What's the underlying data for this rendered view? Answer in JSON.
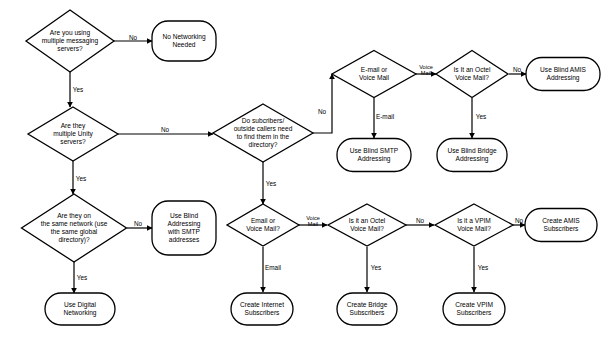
{
  "diagram": {
    "type": "flowchart",
    "background_color": "#ffffff",
    "stroke_color": "#000000",
    "text_color": "#000000",
    "nodes": [
      {
        "id": "q_multi_messaging",
        "shape": "diamond",
        "cx": 70,
        "cy": 41,
        "w": 88,
        "h": 62,
        "lines": [
          "Are you using",
          "multiple messaging",
          "servers?"
        ]
      },
      {
        "id": "t_no_networking",
        "shape": "rounded",
        "cx": 184,
        "cy": 41,
        "w": 64,
        "h": 40,
        "lines": [
          "No Networking",
          "Needed"
        ]
      },
      {
        "id": "q_multi_unity",
        "shape": "diamond",
        "cx": 73,
        "cy": 134,
        "w": 90,
        "h": 54,
        "lines": [
          "Are they",
          "multiple Unity",
          "servers?"
        ]
      },
      {
        "id": "q_same_network",
        "shape": "diamond",
        "cx": 74,
        "cy": 228,
        "w": 105,
        "h": 68,
        "lines": [
          "Are they on",
          "the same network (use",
          "the same global",
          "directory)?"
        ]
      },
      {
        "id": "t_blind_smtp_addresses",
        "shape": "rounded",
        "cx": 184,
        "cy": 228,
        "w": 64,
        "h": 54,
        "lines": [
          "Use Blind",
          "Addressing",
          "with SMTP",
          "addresses"
        ]
      },
      {
        "id": "t_digital_networking",
        "shape": "rounded",
        "cx": 80,
        "cy": 309,
        "w": 70,
        "h": 32,
        "lines": [
          "Use Digital",
          "Networking"
        ]
      },
      {
        "id": "q_find_directory",
        "shape": "diamond",
        "cx": 263,
        "cy": 133,
        "w": 100,
        "h": 58,
        "lines": [
          "Do subcribers/",
          "outside callers need",
          "to find them in the",
          "directory?"
        ]
      },
      {
        "id": "q_email_or_vm_top",
        "shape": "diamond",
        "cx": 374,
        "cy": 74,
        "w": 84,
        "h": 47,
        "lines": [
          "E-mail or",
          "Voice Mail"
        ]
      },
      {
        "id": "q_octel_top",
        "shape": "diamond",
        "cx": 472,
        "cy": 74,
        "w": 72,
        "h": 47,
        "lines": [
          "Is It an Octel",
          "Voice Mail?"
        ]
      },
      {
        "id": "t_blind_amis",
        "shape": "rounded",
        "cx": 563,
        "cy": 74,
        "w": 74,
        "h": 33,
        "lines": [
          "Use Blind AMIS",
          "Addressing"
        ]
      },
      {
        "id": "t_blind_smtp",
        "shape": "rounded",
        "cx": 374,
        "cy": 155,
        "w": 74,
        "h": 33,
        "lines": [
          "Use Blind SMTP",
          "Addressing"
        ]
      },
      {
        "id": "t_blind_bridge",
        "shape": "rounded",
        "cx": 472,
        "cy": 155,
        "w": 70,
        "h": 33,
        "lines": [
          "Use Blind Bridge",
          "Addressing"
        ]
      },
      {
        "id": "q_email_or_vm_bottom",
        "shape": "diamond",
        "cx": 263,
        "cy": 225,
        "w": 72,
        "h": 42,
        "lines": [
          "Email or",
          "Voice Mail?"
        ]
      },
      {
        "id": "q_octel_bottom",
        "shape": "diamond",
        "cx": 367,
        "cy": 225,
        "w": 78,
        "h": 42,
        "lines": [
          "Is it an Octel",
          "Voice Mail?"
        ]
      },
      {
        "id": "q_vpim_bottom",
        "shape": "diamond",
        "cx": 474,
        "cy": 225,
        "w": 78,
        "h": 42,
        "lines": [
          "Is it a VPIM",
          "Voice Mail?"
        ]
      },
      {
        "id": "t_amis_subscribers",
        "shape": "rounded",
        "cx": 561,
        "cy": 225,
        "w": 72,
        "h": 33,
        "lines": [
          "Create AMIS",
          "Subscribers"
        ]
      },
      {
        "id": "t_internet_subscribers",
        "shape": "rounded",
        "cx": 262,
        "cy": 309,
        "w": 62,
        "h": 32,
        "lines": [
          "Create Internet",
          "Subscribers"
        ]
      },
      {
        "id": "t_bridge_subscribers",
        "shape": "rounded",
        "cx": 367,
        "cy": 309,
        "w": 60,
        "h": 32,
        "lines": [
          "Create Bridge",
          "Subscribers"
        ]
      },
      {
        "id": "t_vpim_subscribers",
        "shape": "rounded",
        "cx": 474,
        "cy": 309,
        "w": 62,
        "h": 32,
        "lines": [
          "Create VPIM",
          "Subscribers"
        ]
      }
    ],
    "edges": [
      {
        "id": "e1",
        "from": "q_multi_messaging",
        "to": "t_no_networking",
        "label": "No",
        "points": "114,41 152,41",
        "label_x": 133,
        "label_y": 38,
        "arrow": "right"
      },
      {
        "id": "e2",
        "from": "q_multi_messaging",
        "to": "q_multi_unity",
        "label": "Yes",
        "points": "70,72 70,107",
        "label_x": 78,
        "label_y": 90,
        "arrow": "down"
      },
      {
        "id": "e3",
        "from": "q_multi_unity",
        "to": "q_find_directory",
        "label": "No",
        "points": "118,134 213,134",
        "label_x": 165,
        "label_y": 130,
        "arrow": "right"
      },
      {
        "id": "e4",
        "from": "q_multi_unity",
        "to": "q_same_network",
        "label": "Yes",
        "points": "73,161 73,194",
        "label_x": 81,
        "label_y": 179,
        "arrow": "down"
      },
      {
        "id": "e5",
        "from": "q_same_network",
        "to": "t_blind_smtp_addresses",
        "label": "No",
        "points": "127,228 152,228",
        "label_x": 138,
        "label_y": 224,
        "arrow": "right"
      },
      {
        "id": "e6",
        "from": "q_same_network",
        "to": "t_digital_networking",
        "label": "Yes",
        "points": "74,262 74,293",
        "label_x": 82,
        "label_y": 278,
        "arrow": "down"
      },
      {
        "id": "e7",
        "from": "q_find_directory",
        "to": "q_email_or_vm_top",
        "label": "No",
        "points": "313,133 332,133 332,74",
        "label_x": 322,
        "label_y": 112,
        "arrow": "up-left"
      },
      {
        "id": "e8",
        "from": "q_find_directory",
        "to": "q_email_or_vm_bottom",
        "label": "Yes",
        "points": "263,162 263,204",
        "label_x": 271,
        "label_y": 184,
        "arrow": "down"
      },
      {
        "id": "e9",
        "from": "q_email_or_vm_top",
        "to": "q_octel_top",
        "label": "Voice Mail",
        "points": "416,74 436,74",
        "label_x": 426,
        "label_y": 71,
        "arrow": "right",
        "small": true
      },
      {
        "id": "e10",
        "from": "q_email_or_vm_top",
        "to": "t_blind_smtp",
        "label": "E-mail",
        "points": "374,98 374,138",
        "label_x": 385,
        "label_y": 117,
        "arrow": "down"
      },
      {
        "id": "e11",
        "from": "q_octel_top",
        "to": "t_blind_amis",
        "label": "No",
        "points": "509,74 526,74",
        "label_x": 517,
        "label_y": 70,
        "arrow": "right"
      },
      {
        "id": "e12",
        "from": "q_octel_top",
        "to": "t_blind_bridge",
        "label": "Yes",
        "points": "472,98 472,138",
        "label_x": 481,
        "label_y": 117,
        "arrow": "down"
      },
      {
        "id": "e13",
        "from": "q_email_or_vm_bottom",
        "to": "q_octel_bottom",
        "label": "Voice Mail",
        "points": "299,225 327,225",
        "label_x": 313,
        "label_y": 222,
        "arrow": "right",
        "small": true
      },
      {
        "id": "e14",
        "from": "q_email_or_vm_bottom",
        "to": "t_internet_subscribers",
        "label": "Email",
        "points": "263,247 263,292",
        "label_x": 273,
        "label_y": 268,
        "arrow": "down"
      },
      {
        "id": "e15",
        "from": "q_octel_bottom",
        "to": "q_vpim_bottom",
        "label": "No",
        "points": "406,225 434,225",
        "label_x": 420,
        "label_y": 221,
        "arrow": "right"
      },
      {
        "id": "e16",
        "from": "q_octel_bottom",
        "to": "t_bridge_subscribers",
        "label": "Yes",
        "points": "367,247 367,292",
        "label_x": 376,
        "label_y": 268,
        "arrow": "down"
      },
      {
        "id": "e17",
        "from": "q_vpim_bottom",
        "to": "t_amis_subscribers",
        "label": "No",
        "points": "513,225 525,225",
        "label_x": 519,
        "label_y": 221,
        "arrow": "right"
      },
      {
        "id": "e18",
        "from": "q_vpim_bottom",
        "to": "t_vpim_subscribers",
        "label": "Yes",
        "points": "474,247 474,292",
        "label_x": 483,
        "label_y": 268,
        "arrow": "down"
      }
    ]
  }
}
